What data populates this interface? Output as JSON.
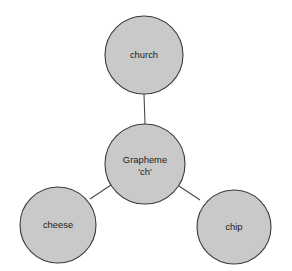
{
  "diagram": {
    "type": "concept-map",
    "background_color": "#ffffff",
    "node_fill_color": "#c9c9c9",
    "node_stroke_color": "#3a3a3a",
    "edge_color": "#4a4a4a",
    "text_color": "#1c1c1c",
    "center_node": {
      "id": "grapheme",
      "label_line1": "Grapheme",
      "label_line2": "'ch'",
      "cx": 145,
      "cy": 164,
      "r": 40
    },
    "outer_nodes": [
      {
        "id": "church",
        "label": "church",
        "cx": 144,
        "cy": 55,
        "r": 39
      },
      {
        "id": "cheese",
        "label": "cheese",
        "cx": 58,
        "cy": 225,
        "r": 38
      },
      {
        "id": "chip",
        "label": "chip",
        "cx": 234,
        "cy": 227,
        "r": 37
      }
    ],
    "edges": [
      {
        "id": "grapheme-church",
        "from": "grapheme",
        "to": "church",
        "x1": 145,
        "y1": 124,
        "x2": 144,
        "y2": 94
      },
      {
        "id": "grapheme-cheese",
        "from": "grapheme",
        "to": "cheese",
        "x1": 111,
        "y1": 185,
        "x2": 90,
        "y2": 199
      },
      {
        "id": "grapheme-chip",
        "from": "grapheme",
        "to": "chip",
        "x1": 179,
        "y1": 186,
        "x2": 200,
        "y2": 200
      }
    ]
  }
}
